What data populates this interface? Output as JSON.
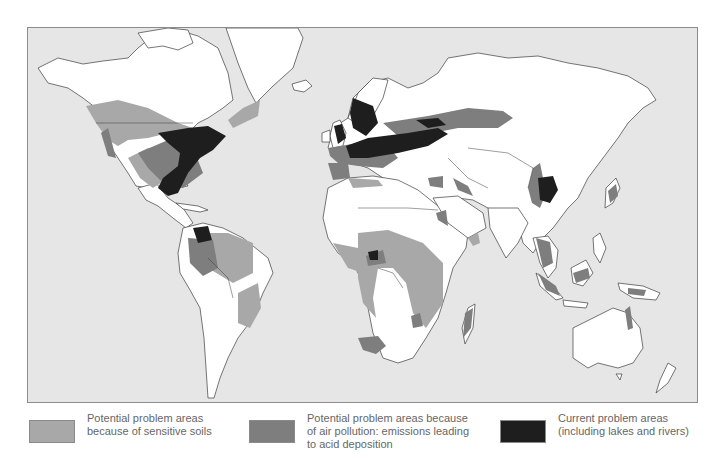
{
  "map": {
    "subject": "World areas affected by acid deposition",
    "background_color": "#e6e6e6",
    "land_color": "#ffffff"
  },
  "legend": {
    "items": [
      {
        "key": "sensitive_soils",
        "label": "Potential problem areas\nbecause of sensitive soils",
        "color": "#a8a8a8"
      },
      {
        "key": "air_pollution",
        "label": "Potential problem areas because\nof air pollution: emissions leading\nto acid deposition",
        "color": "#7e7e7e"
      },
      {
        "key": "current",
        "label": "Current problem areas\n(including lakes and rivers)",
        "color": "#1e1e1e"
      }
    ]
  }
}
